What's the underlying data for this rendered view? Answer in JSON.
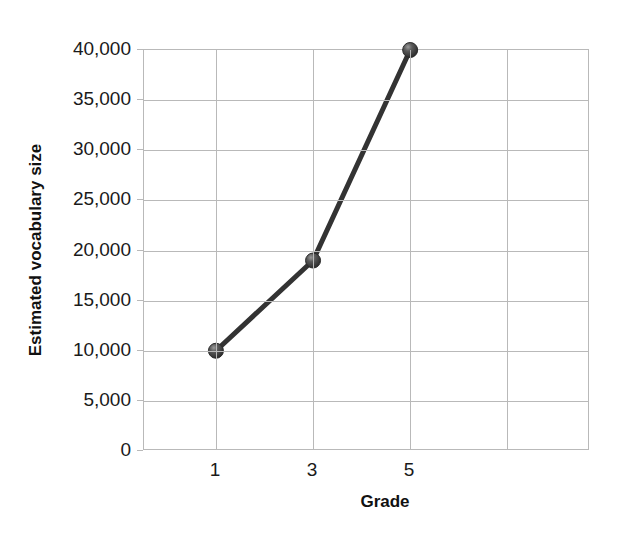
{
  "chart_data": {
    "type": "line",
    "title": "",
    "xlabel": "Grade",
    "ylabel": "Estimated vocabulary size",
    "x": [
      1,
      3,
      5
    ],
    "values": [
      10000,
      19000,
      40000
    ],
    "series": [
      {
        "name": "Estimated vocabulary size",
        "values": [
          10000,
          19000,
          40000
        ],
        "color": "#333333"
      }
    ],
    "xlim": [
      0,
      6.2
    ],
    "ylim": [
      0,
      40000
    ],
    "x_tick_labels": [
      "1",
      "3",
      "5"
    ],
    "x_tick_values": [
      1,
      3,
      5
    ],
    "y_tick_labels": [
      "0",
      "5,000",
      "10,000",
      "15,000",
      "20,000",
      "25,000",
      "30,000",
      "35,000",
      "40,000"
    ],
    "y_tick_values": [
      0,
      5000,
      10000,
      15000,
      20000,
      25000,
      30000,
      35000,
      40000
    ],
    "grid": true,
    "grid_color": "#b9b9b9",
    "legend": false,
    "marker": "sphere",
    "marker_color": "#3a3a3a",
    "line_width": 5,
    "background": "#ffffff"
  }
}
